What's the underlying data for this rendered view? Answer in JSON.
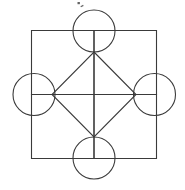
{
  "figure": {
    "title": "Geometric figure: four squares, four circles, central diamond",
    "background_color": "#ffffff",
    "stroke_color": "#3a3a3a",
    "stroke_width": 1.1,
    "canvas": {
      "width": 185,
      "height": 190
    }
  },
  "grid": {
    "name": "two-by-two-square-grid",
    "left": 31.5,
    "top": 30.5,
    "right": 156.5,
    "bottom": 158.5,
    "center_x": 94,
    "center_y": 94.5,
    "cell_count": 4,
    "cells": [
      {
        "label": "top-left-square",
        "x": 31.5,
        "y": 30.5,
        "w": 62.5,
        "h": 64
      },
      {
        "label": "top-right-square",
        "x": 94,
        "y": 30.5,
        "w": 62.5,
        "h": 64
      },
      {
        "label": "bottom-left-square",
        "x": 31.5,
        "y": 94.5,
        "w": 62.5,
        "h": 64
      },
      {
        "label": "bottom-right-square",
        "x": 94,
        "y": 94.5,
        "w": 62.5,
        "h": 64
      }
    ]
  },
  "circles": [
    {
      "label": "top-circle",
      "cx": 94,
      "cy": 31,
      "r": 21
    },
    {
      "label": "left-circle",
      "cx": 34,
      "cy": 94.5,
      "r": 21
    },
    {
      "label": "right-circle",
      "cx": 154.5,
      "cy": 94.5,
      "r": 21
    },
    {
      "label": "bottom-circle",
      "cx": 94,
      "cy": 158,
      "r": 21
    }
  ],
  "diamond": {
    "label": "central-diamond",
    "points": "94,52 136,94.5 94,137 52,94.5",
    "vertices": [
      {
        "name": "top",
        "x": 94,
        "y": 52
      },
      {
        "name": "right",
        "x": 136,
        "y": 94.5
      },
      {
        "name": "bottom",
        "x": 94,
        "y": 137
      },
      {
        "name": "left",
        "x": 52,
        "y": 94.5
      }
    ]
  },
  "artifacts": [
    {
      "label": "top-speck-1",
      "x": 77.5,
      "y": 2.0,
      "w": 2.4,
      "h": 2.2
    },
    {
      "label": "top-speck-2",
      "x": 80.5,
      "y": 5.4,
      "w": 3.0,
      "h": 1.3
    }
  ]
}
